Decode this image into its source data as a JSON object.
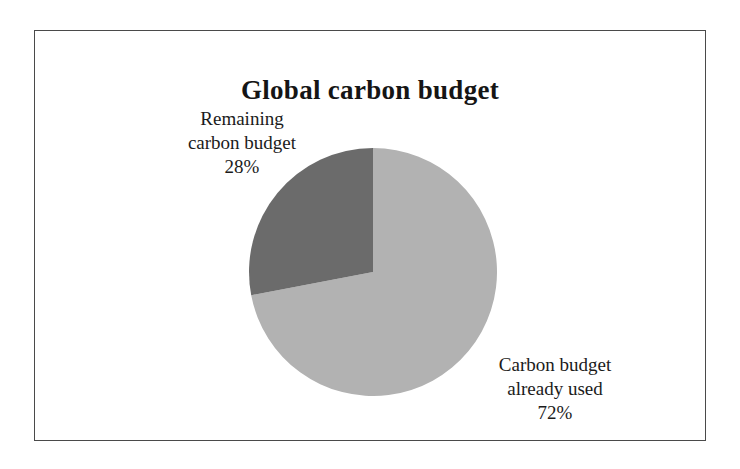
{
  "chart_data": {
    "type": "pie",
    "title": "Global carbon budget",
    "categories": [
      "Carbon budget already used",
      "Remaining carbon budget"
    ],
    "values": [
      72,
      28
    ],
    "value_labels": [
      "72%",
      "28%"
    ],
    "units": "percent",
    "legend": "none",
    "labels_position": "outside-callout",
    "start_angle_deg": 0,
    "direction": "clockwise",
    "slice_colors": [
      "#b2b2b2",
      "#6b6b6b"
    ],
    "slices": [
      {
        "name": "Carbon budget already used",
        "value": 72,
        "value_label": "72%",
        "color": "#b2b2b2",
        "label_lines": [
          "Carbon budget",
          "already used",
          "72%"
        ]
      },
      {
        "name": "Remaining carbon budget",
        "value": 28,
        "value_label": "28%",
        "color": "#6b6b6b",
        "label_lines": [
          "Remaining",
          "carbon budget",
          "28%"
        ]
      }
    ]
  },
  "figure": {
    "title": "Global carbon budget",
    "border_color": "#4a4a4a",
    "background": "#ffffff"
  },
  "labels": {
    "remaining": {
      "line1": "Remaining",
      "line2": "carbon budget",
      "percent": "28%"
    },
    "used": {
      "line1": "Carbon budget",
      "line2": "already used",
      "percent": "72%"
    }
  }
}
